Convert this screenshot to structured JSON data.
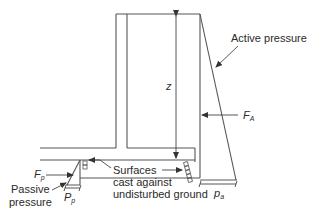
{
  "diagram": {
    "labels": {
      "active_pressure": "Active pressure",
      "z": "z",
      "FA_main": "F",
      "FA_sub": "A",
      "pa_main": "p",
      "pa_sub": "a",
      "Fp_main": "F",
      "Fp_sub": "p",
      "Pp_main": "P",
      "Pp_sub": "p",
      "passive_line1": "Passive",
      "passive_line2": "pressure",
      "surfaces_line1": "Surfaces",
      "surfaces_line2": "cast against",
      "surfaces_line3": "undisturbed ground"
    },
    "colors": {
      "stroke": "#555555",
      "text": "#2a2a2a"
    }
  }
}
